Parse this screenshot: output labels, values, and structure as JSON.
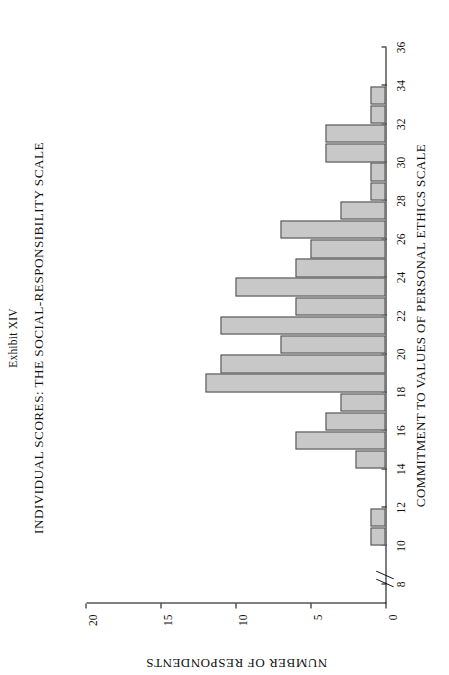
{
  "page": {
    "exhibit_label": "Exhibit XIV",
    "title": "INDIVIDUAL SCORES:  THE SOCIAL-RESPONSIBILITY SCALE"
  },
  "chart_data": {
    "type": "bar",
    "orientation": "horizontal-rotated-page",
    "title": "INDIVIDUAL SCORES:  THE SOCIAL-RESPONSIBILITY SCALE",
    "subtitle": "Exhibit XIV",
    "xlabel": "COMMITMENT TO VALUES OF PERSONAL ETHICS SCALE",
    "ylabel": "NUMBER OF RESPONDENTS",
    "xlim": [
      7,
      36
    ],
    "ylim": [
      0,
      20
    ],
    "grid": false,
    "legend": null,
    "axis_break": true,
    "bar_fill": "#c8c8c8",
    "bar_edge": "#4a4a4a",
    "xticks": [
      8,
      10,
      12,
      14,
      16,
      18,
      20,
      22,
      24,
      26,
      28,
      30,
      32,
      34,
      36
    ],
    "xtick_labels": [
      "8",
      "10",
      "12",
      "14",
      "16",
      "18",
      "20",
      "22",
      "24",
      "26",
      "28",
      "30",
      "32",
      "34",
      "36"
    ],
    "yticks": [
      0,
      5,
      10,
      15,
      20
    ],
    "ytick_labels": [
      "0",
      "5",
      "10",
      "15",
      "20"
    ],
    "origin_tick_label": "0",
    "categories": [
      10,
      11,
      14,
      15,
      16,
      17,
      18,
      19,
      20,
      21,
      22,
      23,
      24,
      25,
      26,
      27,
      28,
      29,
      30,
      31,
      32,
      33
    ],
    "values": [
      1,
      1,
      2,
      6,
      4,
      3,
      12,
      11,
      7,
      11,
      6,
      10,
      6,
      5,
      7,
      3,
      1,
      1,
      4,
      4,
      1,
      1
    ],
    "bars": [
      {
        "score": 10,
        "count": 1
      },
      {
        "score": 11,
        "count": 1
      },
      {
        "score": 14,
        "count": 2
      },
      {
        "score": 15,
        "count": 6
      },
      {
        "score": 16,
        "count": 4
      },
      {
        "score": 17,
        "count": 3
      },
      {
        "score": 18,
        "count": 12
      },
      {
        "score": 19,
        "count": 11
      },
      {
        "score": 20,
        "count": 7
      },
      {
        "score": 21,
        "count": 11
      },
      {
        "score": 22,
        "count": 6
      },
      {
        "score": 23,
        "count": 10
      },
      {
        "score": 24,
        "count": 6
      },
      {
        "score": 25,
        "count": 5
      },
      {
        "score": 26,
        "count": 7
      },
      {
        "score": 27,
        "count": 3
      },
      {
        "score": 28,
        "count": 1
      },
      {
        "score": 29,
        "count": 1
      },
      {
        "score": 30,
        "count": 4
      },
      {
        "score": 31,
        "count": 4
      },
      {
        "score": 32,
        "count": 1
      },
      {
        "score": 33,
        "count": 1
      }
    ]
  }
}
